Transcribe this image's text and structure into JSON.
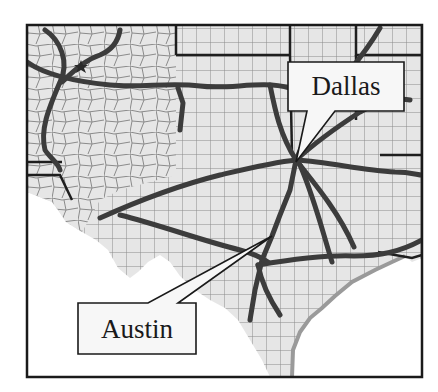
{
  "map": {
    "region": "Texas and surrounding states",
    "colors": {
      "land": "#e6e6e6",
      "water": "#ffffff",
      "county_lines": "#8a8a8a",
      "state_lines": "#1e1e1e",
      "highways": "#3c3c3c",
      "highway_casing": "#6a6a6a",
      "frame": "#1a1a1a",
      "callout_fill": "#f7f7f7"
    }
  },
  "callouts": [
    {
      "label": "Dallas"
    },
    {
      "label": "Austin"
    }
  ]
}
